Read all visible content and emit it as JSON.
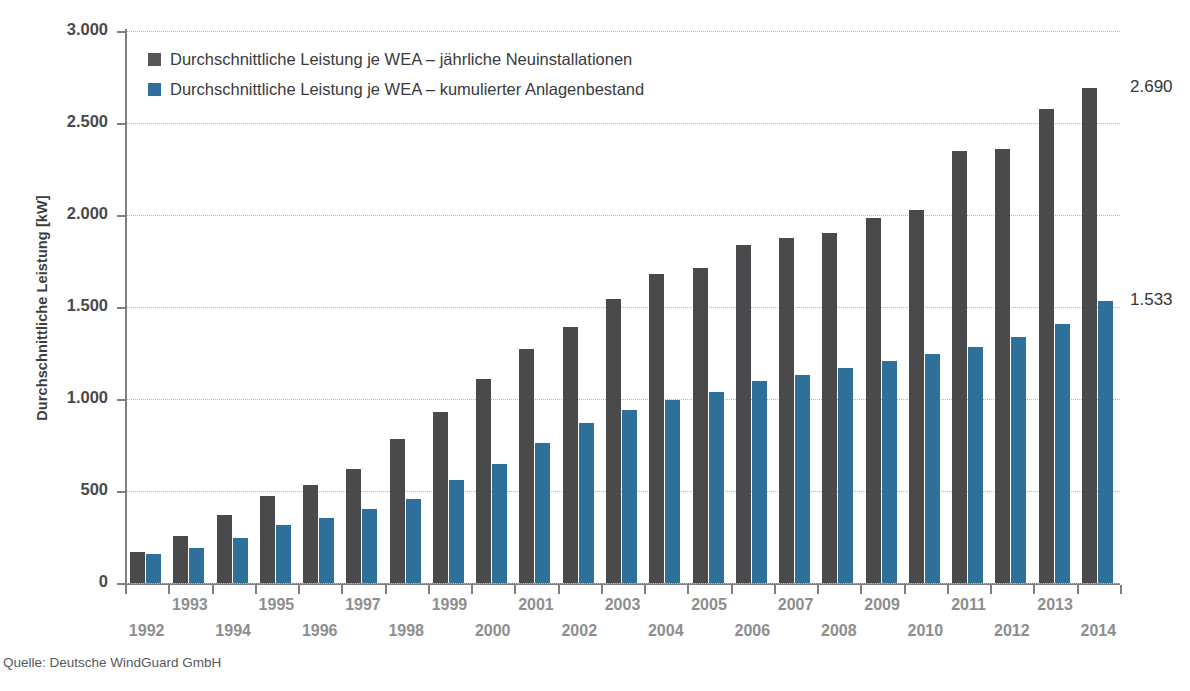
{
  "chart_data": {
    "type": "bar",
    "title": "",
    "xlabel": "",
    "ylabel": "Durchschnittliche Leistung [kW]",
    "ylim": [
      0,
      3000
    ],
    "ytick_labels": [
      "3.000",
      "2.500",
      "2.000",
      "1.500",
      "1.000",
      "500",
      "0"
    ],
    "ytick_values": [
      3000,
      2500,
      2000,
      1500,
      1000,
      500,
      0
    ],
    "grid": true,
    "legend_position": "upper-left inside plot",
    "categories": [
      "1992",
      "1993",
      "1994",
      "1995",
      "1996",
      "1997",
      "1998",
      "1999",
      "2000",
      "2001",
      "2002",
      "2003",
      "2004",
      "2005",
      "2006",
      "2007",
      "2008",
      "2009",
      "2010",
      "2011",
      "2012",
      "2013",
      "2014"
    ],
    "series": [
      {
        "name": "Durchschnittliche Leistung je WEA – jährliche Neuinstallationen",
        "color": "#4a4a4d",
        "values": [
          168,
          253,
          370,
          473,
          530,
          621,
          785,
          931,
          1110,
          1272,
          1391,
          1545,
          1681,
          1712,
          1838,
          1874,
          1901,
          1982,
          2027,
          2348,
          2358,
          2576,
          2690
        ]
      },
      {
        "name": "Durchschnittliche Leistung je WEA – kumulierter Anlagenbestand",
        "color": "#2e7099",
        "values": [
          158,
          190,
          245,
          313,
          353,
          402,
          457,
          560,
          648,
          763,
          870,
          943,
          996,
          1040,
          1096,
          1131,
          1168,
          1208,
          1243,
          1285,
          1338,
          1408,
          1533
        ]
      }
    ],
    "annotations": [
      {
        "text": "2.690",
        "series": "Durchschnittliche Leistung je WEA – jährliche Neuinstallationen",
        "category": "2014",
        "value": 2690
      },
      {
        "text": "1.533",
        "series": "Durchschnittliche Leistung je WEA – kumulierter Anlagenbestand",
        "category": "2014",
        "value": 1533
      }
    ]
  },
  "legend": {
    "items": [
      {
        "label": "Durchschnittliche Leistung je WEA – jährliche Neuinstallationen",
        "color": "#57575a"
      },
      {
        "label": "Durchschnittliche Leistung je WEA – kumulierter Anlagenbestand",
        "color": "#2e7099"
      }
    ]
  },
  "labels": {
    "end_label_top": "2.690",
    "end_label_bottom": "1.533"
  },
  "source": {
    "text": "Quelle: Deutsche WindGuard GmbH"
  },
  "colors": {
    "series_dark": "#4a4a4d",
    "series_blue": "#2e7099",
    "axis": "#7f7f82",
    "grid": "#b9b9bb",
    "tick_text": "#8e8e90",
    "background": "#ffffff"
  }
}
